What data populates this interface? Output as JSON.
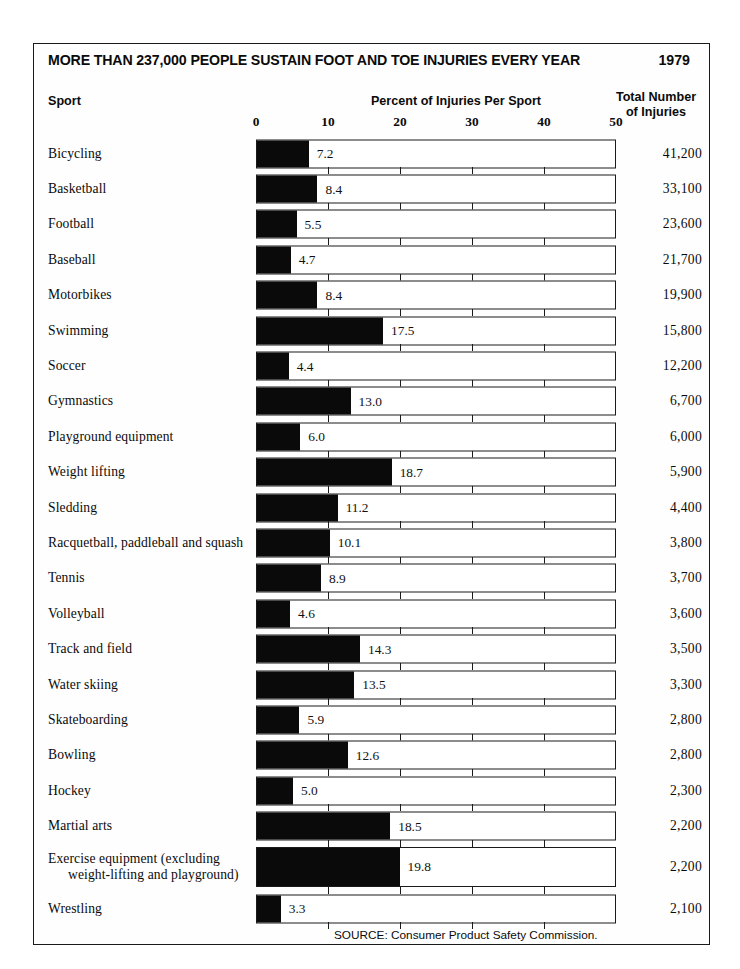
{
  "chart_data": {
    "type": "bar",
    "title": "MORE THAN 237,000 PEOPLE SUSTAIN FOOT AND TOE INJURIES EVERY YEAR",
    "year": "1979",
    "orientation": "horizontal",
    "xlabel": "Percent of Injuries Per Sport",
    "ylabel": "Sport",
    "xlim": [
      0,
      50
    ],
    "xticks": [
      0,
      10,
      20,
      30,
      40,
      50
    ],
    "xtick_labels": [
      "0",
      "10",
      "20",
      "30",
      "40",
      "50"
    ],
    "grid": false,
    "legend": null,
    "column_headers": {
      "sport": "Sport",
      "percent": "Percent of Injuries Per Sport",
      "total_line1": "Total Number",
      "total_line2": "of Injuries"
    },
    "categories": [
      "Bicycling",
      "Basketball",
      "Football",
      "Baseball",
      "Motorbikes",
      "Swimming",
      "Soccer",
      "Gymnastics",
      "Playground equipment",
      "Weight lifting",
      "Sledding",
      "Racquetball, paddleball and squash",
      "Tennis",
      "Volleyball",
      "Track and field",
      "Water skiing",
      "Skateboarding",
      "Bowling",
      "Hockey",
      "Martial arts",
      "Exercise equipment (excluding weight-lifting and playground)",
      "Wrestling"
    ],
    "values": [
      7.2,
      8.4,
      5.5,
      4.7,
      8.4,
      17.5,
      4.4,
      13.0,
      6.0,
      18.7,
      11.2,
      10.1,
      8.9,
      4.6,
      14.3,
      13.5,
      5.9,
      12.6,
      5.0,
      18.5,
      19.8,
      3.3
    ],
    "value_labels": [
      "7.2",
      "8.4",
      "5.5",
      "4.7",
      "8.4",
      "17.5",
      "4.4",
      "13.0",
      "6.0",
      "18.7",
      "11.2",
      "10.1",
      "8.9",
      "4.6",
      "14.3",
      "13.5",
      "5.9",
      "12.6",
      "5.0",
      "18.5",
      "19.8",
      "3.3"
    ],
    "totals": [
      41200,
      33100,
      23600,
      21700,
      19900,
      15800,
      12200,
      6700,
      6000,
      5900,
      4400,
      3800,
      3700,
      3600,
      3500,
      3300,
      2800,
      2800,
      2300,
      2200,
      2200,
      2100
    ],
    "total_labels": [
      "41,200",
      "33,100",
      "23,600",
      "21,700",
      "19,900",
      "15,800",
      "12,200",
      "6,700",
      "6,000",
      "5,900",
      "4,400",
      "3,800",
      "3,700",
      "3,600",
      "3,500",
      "3,300",
      "2,800",
      "2,800",
      "2,300",
      "2,200",
      "2,200",
      "2,100"
    ],
    "source": "SOURCE: Consumer Product Safety Commission.",
    "bar_color": "#0a0a0a",
    "track_color": "#ffffff",
    "border_color": "#1a1a1a"
  },
  "rows": [
    {
      "sport": "Bicycling",
      "sport_line2": "",
      "value": 7.2,
      "value_label": "7.2",
      "total_label": "41,200"
    },
    {
      "sport": "Basketball",
      "sport_line2": "",
      "value": 8.4,
      "value_label": "8.4",
      "total_label": "33,100"
    },
    {
      "sport": "Football",
      "sport_line2": "",
      "value": 5.5,
      "value_label": "5.5",
      "total_label": "23,600"
    },
    {
      "sport": "Baseball",
      "sport_line2": "",
      "value": 4.7,
      "value_label": "4.7",
      "total_label": "21,700"
    },
    {
      "sport": "Motorbikes",
      "sport_line2": "",
      "value": 8.4,
      "value_label": "8.4",
      "total_label": "19,900"
    },
    {
      "sport": "Swimming",
      "sport_line2": "",
      "value": 17.5,
      "value_label": "17.5",
      "total_label": "15,800"
    },
    {
      "sport": "Soccer",
      "sport_line2": "",
      "value": 4.4,
      "value_label": "4.4",
      "total_label": "12,200"
    },
    {
      "sport": "Gymnastics",
      "sport_line2": "",
      "value": 13.0,
      "value_label": "13.0",
      "total_label": "6,700"
    },
    {
      "sport": "Playground equipment",
      "sport_line2": "",
      "value": 6.0,
      "value_label": "6.0",
      "total_label": "6,000"
    },
    {
      "sport": "Weight lifting",
      "sport_line2": "",
      "value": 18.7,
      "value_label": "18.7",
      "total_label": "5,900"
    },
    {
      "sport": "Sledding",
      "sport_line2": "",
      "value": 11.2,
      "value_label": "11.2",
      "total_label": "4,400"
    },
    {
      "sport": "Racquetball, paddleball and squash",
      "sport_line2": "",
      "value": 10.1,
      "value_label": "10.1",
      "total_label": "3,800"
    },
    {
      "sport": "Tennis",
      "sport_line2": "",
      "value": 8.9,
      "value_label": "8.9",
      "total_label": "3,700"
    },
    {
      "sport": "Volleyball",
      "sport_line2": "",
      "value": 4.6,
      "value_label": "4.6",
      "total_label": "3,600"
    },
    {
      "sport": "Track and field",
      "sport_line2": "",
      "value": 14.3,
      "value_label": "14.3",
      "total_label": "3,500"
    },
    {
      "sport": "Water skiing",
      "sport_line2": "",
      "value": 13.5,
      "value_label": "13.5",
      "total_label": "3,300"
    },
    {
      "sport": "Skateboarding",
      "sport_line2": "",
      "value": 5.9,
      "value_label": "5.9",
      "total_label": "2,800"
    },
    {
      "sport": "Bowling",
      "sport_line2": "",
      "value": 12.6,
      "value_label": "12.6",
      "total_label": "2,800"
    },
    {
      "sport": "Hockey",
      "sport_line2": "",
      "value": 5.0,
      "value_label": "5.0",
      "total_label": "2,300"
    },
    {
      "sport": "Martial arts",
      "sport_line2": "",
      "value": 18.5,
      "value_label": "18.5",
      "total_label": "2,200"
    },
    {
      "sport": "Exercise equipment (excluding",
      "sport_line2": "weight-lifting and playground)",
      "value": 19.8,
      "value_label": "19.8",
      "total_label": "2,200"
    },
    {
      "sport": "Wrestling",
      "sport_line2": "",
      "value": 3.3,
      "value_label": "3.3",
      "total_label": "2,100"
    }
  ]
}
